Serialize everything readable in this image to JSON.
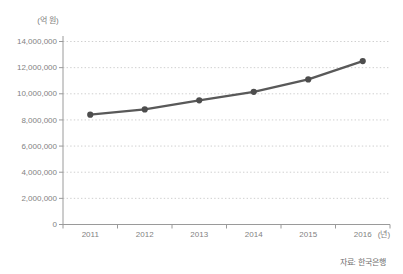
{
  "chart": {
    "unit_label": "(억 원)",
    "x_unit_label": "(년)",
    "source": "자료: 한국은행"
  },
  "chart_data": {
    "type": "line",
    "title": "",
    "categories": [
      "2011",
      "2012",
      "2013",
      "2014",
      "2015",
      "2016"
    ],
    "values": [
      8400000,
      8800000,
      9500000,
      10150000,
      11100000,
      12500000
    ],
    "series": [
      {
        "name": "금액(억 원)",
        "values": [
          8400000,
          8800000,
          9500000,
          10150000,
          11100000,
          12500000
        ]
      }
    ],
    "xlabel": "(년)",
    "ylabel": "(억 원)",
    "ylim": [
      0,
      14000000
    ],
    "y_tick_step": 2000000,
    "y_tick_labels": [
      "0",
      "2,000,000",
      "4,000,000",
      "6,000,000",
      "8,000,000",
      "10,000,000",
      "12,000,000",
      "14,000,000"
    ],
    "grid": "horizontal-dotted",
    "legend": "none",
    "annotations": [
      "자료: 한국은행"
    ],
    "colors": {
      "line": "#595959",
      "marker": "#4d4d4d",
      "grid": "#c9c9c9",
      "axis": "#9a9a9a",
      "tick_text": "#828282"
    }
  }
}
